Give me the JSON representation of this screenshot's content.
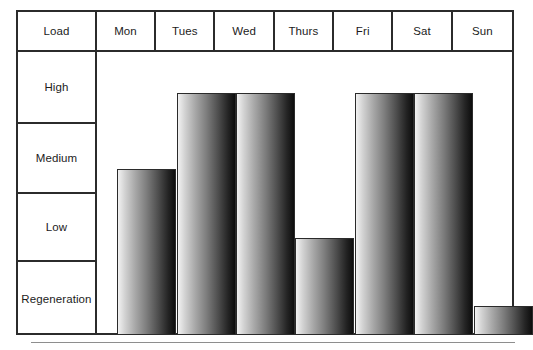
{
  "chart_data": {
    "type": "bar",
    "title": "",
    "subtitle": "",
    "xlabel": "",
    "ylabel": "Load",
    "grid": true,
    "legend": "none",
    "orientation": "vertical",
    "corner_label": "Load",
    "categories": [
      "Mon",
      "Tues",
      "Wed",
      "Thurs",
      "Fri",
      "Sat",
      "Sun"
    ],
    "y_categories": [
      "High",
      "Medium",
      "Low",
      "Regeneration"
    ],
    "y_category_order": "top-to-bottom",
    "values": [
      "High",
      "High",
      "High",
      "Low",
      "High",
      "High",
      "Regeneration"
    ],
    "numeric_values": [
      3,
      4,
      4,
      2,
      4,
      4,
      1
    ],
    "ylim": [
      0,
      4
    ],
    "series": [
      {
        "name": "Training load",
        "points": [
          {
            "day": "Mon",
            "level": "Medium",
            "level_index": 3
          },
          {
            "day": "Tues",
            "level": "High",
            "level_index": 4
          },
          {
            "day": "Wed",
            "level": "High",
            "level_index": 4
          },
          {
            "day": "Thurs",
            "level": "Low",
            "level_index": 2
          },
          {
            "day": "Fri",
            "level": "High",
            "level_index": 4
          },
          {
            "day": "Sat",
            "level": "High",
            "level_index": 4
          },
          {
            "day": "Sun",
            "level": "Regeneration",
            "level_index": 1
          }
        ]
      }
    ]
  },
  "table": {
    "header": {
      "corner": "Load",
      "columns": [
        "Mon",
        "Tues",
        "Wed",
        "Thurs",
        "Fri",
        "Sat",
        "Sun"
      ]
    },
    "rows": [
      {
        "label": "High"
      },
      {
        "label": "Medium"
      },
      {
        "label": "Low"
      },
      {
        "label": "Regeneration"
      }
    ]
  },
  "colors": {
    "border": "#2b2b2b",
    "background": "#ffffff",
    "text": "#1c1c1c",
    "bar_gradient_start": "#f2f2f2",
    "bar_gradient_end": "#0d0d0d",
    "footer_rule": "#8e8e8e"
  },
  "bars": [
    {
      "day": "Mon",
      "level": "Medium",
      "left": 17.5,
      "width": 59.4,
      "top": 117
    },
    {
      "day": "Tues",
      "level": "High",
      "left": 77.5,
      "width": 59.4,
      "top": 41
    },
    {
      "day": "Wed",
      "level": "High",
      "left": 136.5,
      "width": 59.4,
      "top": 41
    },
    {
      "day": "Thurs",
      "level": "Low",
      "left": 196,
      "width": 59.4,
      "top": 186
    },
    {
      "day": "Fri",
      "level": "High",
      "left": 255.5,
      "width": 59.4,
      "top": 41
    },
    {
      "day": "Sat",
      "level": "High",
      "left": 315,
      "width": 59.4,
      "top": 41
    },
    {
      "day": "Sun",
      "level": "Regeneration",
      "left": 374.5,
      "width": 59.4,
      "top": 254
    }
  ],
  "row_heights": [
    72,
    70,
    68,
    73
  ]
}
